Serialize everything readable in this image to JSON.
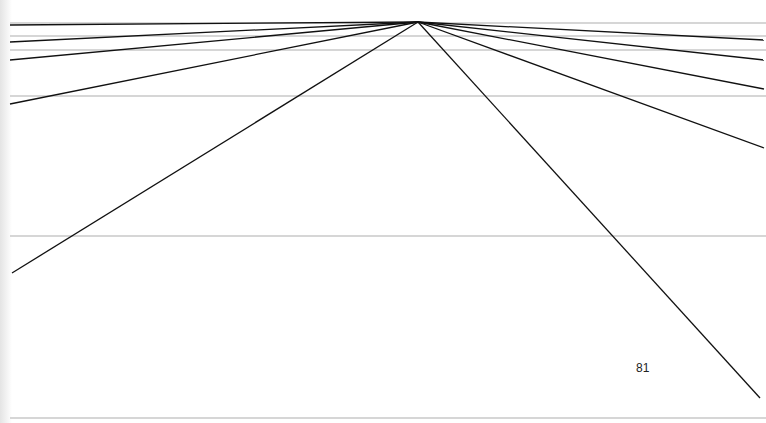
{
  "page": {
    "page_number": "81"
  },
  "figure": {
    "line_color": "#111111",
    "guide_color": "#d6d6d6",
    "guide_count": 6,
    "ray_count": 10,
    "rays_left_count": 5,
    "rays_right_count": 5
  }
}
